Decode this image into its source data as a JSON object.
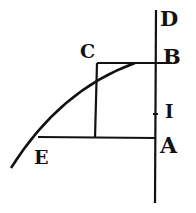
{
  "diagram": {
    "type": "geometric-figure",
    "stroke_color": "#111111",
    "background": "#ffffff",
    "labels": {
      "D": "D",
      "B": "B",
      "C": "C",
      "I": "I",
      "A": "A",
      "E": "E"
    },
    "points": {
      "D": [
        156,
        10
      ],
      "B": [
        156,
        63
      ],
      "C": [
        97,
        63
      ],
      "I": [
        156,
        114
      ],
      "A": [
        156,
        138
      ],
      "E": [
        38,
        136
      ]
    },
    "segments": [
      {
        "name": "axis-DA",
        "from": [
          156,
          10
        ],
        "to": [
          155,
          203
        ]
      },
      {
        "name": "segment-CB",
        "from": [
          97,
          63
        ],
        "to": [
          172,
          63
        ]
      },
      {
        "name": "segment-C-down",
        "from": [
          97,
          63
        ],
        "to": [
          95,
          138
        ]
      },
      {
        "name": "segment-EA",
        "from": [
          38,
          137
        ],
        "to": [
          156,
          138
        ]
      }
    ],
    "curve": {
      "name": "curve-EB",
      "path": "M 11 168 Q 60 90 135 63"
    }
  }
}
